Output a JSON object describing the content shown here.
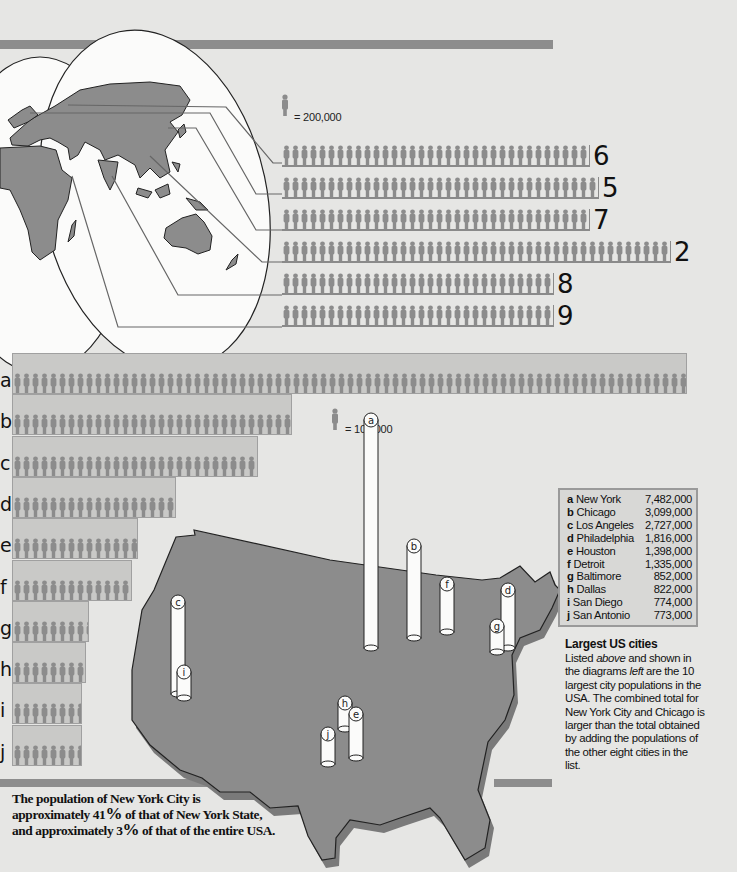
{
  "decor": {
    "top_rule": {
      "x": 0,
      "y": 40,
      "w": 553,
      "h": 9
    },
    "bottom_rules": [
      {
        "x": 0,
        "y": 779,
        "w": 302,
        "h": 8
      },
      {
        "x": 343,
        "y": 779,
        "w": 120,
        "h": 8
      },
      {
        "x": 494,
        "y": 779,
        "w": 58,
        "h": 8
      }
    ]
  },
  "world_chart": {
    "legend": {
      "value_label": "= 200,000",
      "unit_value": 200000
    },
    "rows": [
      {
        "rank_label": "6",
        "figures": 34
      },
      {
        "rank_label": "5",
        "figures": 35
      },
      {
        "rank_label": "7",
        "figures": 34
      },
      {
        "rank_label": "2",
        "figures": 43
      },
      {
        "rank_label": "8",
        "figures": 30
      },
      {
        "rank_label": "9",
        "figures": 30
      }
    ]
  },
  "us_chart": {
    "legend": {
      "value_label": "= 100,000",
      "unit_value": 100000
    },
    "rows": [
      {
        "letter": "a",
        "city": "New York",
        "population": "7,482,000",
        "value": 7482000
      },
      {
        "letter": "b",
        "city": "Chicago",
        "population": "3,099,000",
        "value": 3099000
      },
      {
        "letter": "c",
        "city": "Los Angeles",
        "population": "2,727,000",
        "value": 2727000
      },
      {
        "letter": "d",
        "city": "Philadelphia",
        "population": "1,816,000",
        "value": 1816000
      },
      {
        "letter": "e",
        "city": "Houston",
        "population": "1,398,000",
        "value": 1398000
      },
      {
        "letter": "f",
        "city": "Detroit",
        "population": "1,335,000",
        "value": 1335000
      },
      {
        "letter": "g",
        "city": "Baltimore",
        "population": "852,000",
        "value": 852000
      },
      {
        "letter": "h",
        "city": "Dallas",
        "population": "822,000",
        "value": 822000
      },
      {
        "letter": "i",
        "city": "San Diego",
        "population": "774,000",
        "value": 774000
      },
      {
        "letter": "j",
        "city": "San Antonio",
        "population": "773,000",
        "value": 773000
      }
    ]
  },
  "caption": {
    "title": "Largest US cities",
    "body_parts": [
      "Listed ",
      "above",
      " and shown in the diagrams ",
      "left",
      " are the 10 largest city populations in the USA. The combined total for New York City and Chicago is larger than the total obtained by adding the populations of the other eight cities in the list."
    ]
  },
  "footnote": {
    "line1": "The population of New York City is",
    "line2_pre": "approximately 41",
    "line2_pct": "%",
    "line2_post": " of that of New York State,",
    "line3_pre": "and approximately 3",
    "line3_pct": "%",
    "line3_post": " of that of the entire USA."
  },
  "chart_data": [
    {
      "type": "bar",
      "title": "World's largest cities (pictogram, 1 figure = 200,000)",
      "orientation": "horizontal",
      "categories": [
        "6",
        "5",
        "7",
        "2",
        "8",
        "9"
      ],
      "series": [
        {
          "name": "Population (figures × 200,000)",
          "values": [
            6800000,
            7000000,
            6800000,
            8600000,
            6000000,
            6000000
          ]
        }
      ],
      "xlabel": "",
      "ylabel": "",
      "legend": "= 200,000"
    },
    {
      "type": "bar",
      "title": "Largest US cities",
      "orientation": "horizontal",
      "categories": [
        "a New York",
        "b Chicago",
        "c Los Angeles",
        "d Philadelphia",
        "e Houston",
        "f Detroit",
        "g Baltimore",
        "h Dallas",
        "i San Diego",
        "j San Antonio"
      ],
      "values": [
        7482000,
        3099000,
        2727000,
        1816000,
        1398000,
        1335000,
        852000,
        822000,
        774000,
        773000
      ],
      "xlabel": "",
      "ylabel": "",
      "legend": "= 100,000",
      "xlim": [
        0,
        7500000
      ]
    }
  ]
}
